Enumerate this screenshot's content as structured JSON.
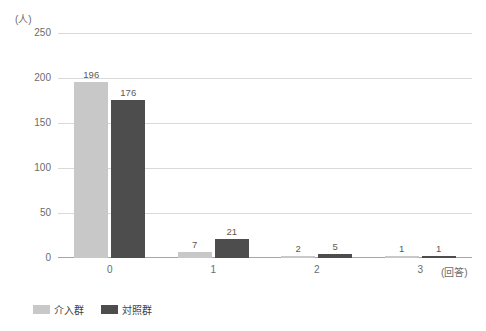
{
  "chart_data": {
    "type": "bar",
    "title": "",
    "subtitle": "",
    "xlabel": "(回答)",
    "ylabel": "(人)",
    "categories": [
      "0",
      "1",
      "2",
      "3"
    ],
    "series": [
      {
        "name": "介入群",
        "color": "#c8c8c8",
        "values": [
          196,
          7,
          2,
          1
        ]
      },
      {
        "name": "対照群",
        "color": "#4d4d4d",
        "values": [
          176,
          21,
          5,
          1
        ]
      }
    ],
    "ylim": [
      0,
      250
    ],
    "ytick_values": [
      0,
      50,
      100,
      150,
      200,
      250
    ],
    "ytick_labels": [
      "0",
      "50",
      "100",
      "150",
      "200",
      "250"
    ],
    "grid": true,
    "legend_position": "bottom-left",
    "value_labels": true
  },
  "axes": {
    "y_unit": "(人)",
    "x_unit": "(回答)"
  },
  "legend": {
    "items": [
      {
        "label": "介入群",
        "color": "#c8c8c8"
      },
      {
        "label": "対照群",
        "color": "#4d4d4d"
      }
    ]
  },
  "caption": {
    "clipped_text": ""
  },
  "colors": {
    "series_light": "#c8c8c8",
    "series_dark": "#4d4d4d",
    "gridline": "#d9d9d9",
    "axis": "#a6a6a6",
    "text": "#6b6b6b",
    "background": "#ffffff"
  }
}
